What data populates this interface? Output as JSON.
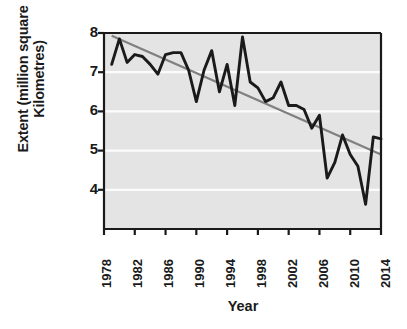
{
  "chart_data": {
    "type": "line",
    "title": "",
    "xlabel": "Year",
    "ylabel": "Extent (million square Kilometres)",
    "xlim": [
      1978,
      2014
    ],
    "ylim": [
      3.0,
      8.0
    ],
    "xticks": [
      1978,
      1982,
      1986,
      1990,
      1994,
      1998,
      2002,
      2006,
      2010,
      2014
    ],
    "yticks": [
      4,
      5,
      6,
      7,
      8
    ],
    "grid": "horizontal-white-gridlines",
    "legend": "none",
    "plot_background": "#e4e4e4",
    "series": [
      {
        "name": "Sea ice extent",
        "color": "#1a1a1a",
        "type": "line",
        "x": [
          1979,
          1980,
          1981,
          1982,
          1983,
          1984,
          1985,
          1986,
          1987,
          1988,
          1989,
          1990,
          1991,
          1992,
          1993,
          1994,
          1995,
          1996,
          1997,
          1998,
          1999,
          2000,
          2001,
          2002,
          2003,
          2004,
          2005,
          2006,
          2007,
          2008,
          2009,
          2010,
          2011,
          2012,
          2013,
          2014
        ],
        "values": [
          7.2,
          7.85,
          7.25,
          7.45,
          7.4,
          7.2,
          6.95,
          7.45,
          7.5,
          7.5,
          7.05,
          6.25,
          7.05,
          7.55,
          6.5,
          7.2,
          6.15,
          7.9,
          6.75,
          6.6,
          6.25,
          6.35,
          6.75,
          6.15,
          6.15,
          6.05,
          5.57,
          5.9,
          4.3,
          4.7,
          5.4,
          4.9,
          4.6,
          3.63,
          5.35,
          5.3
        ]
      },
      {
        "name": "Linear trend",
        "color": "#808080",
        "type": "trendline",
        "x": [
          1979,
          2014
        ],
        "values": [
          7.93,
          4.9
        ]
      }
    ]
  },
  "axes": {
    "ylabel_text": "Extent (million square Kilometres)",
    "xlabel_text": "Year",
    "ytick_labels": [
      "8",
      "7",
      "6",
      "5",
      "4"
    ],
    "xtick_labels": [
      "1978",
      "1982",
      "1986",
      "1990",
      "1994",
      "1998",
      "2002",
      "2006",
      "2010",
      "2014"
    ]
  }
}
